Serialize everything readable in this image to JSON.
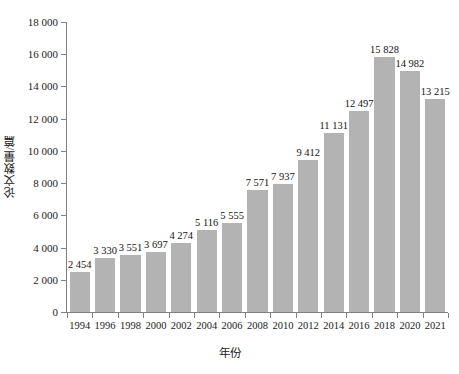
{
  "chart_data": {
    "type": "bar",
    "title": "",
    "xlabel": "年份",
    "ylabel": "论文数量/篇",
    "categories": [
      "1994",
      "1996",
      "1998",
      "2000",
      "2002",
      "2004",
      "2006",
      "2008",
      "2010",
      "2012",
      "2014",
      "2016",
      "2018",
      "2020",
      "2021"
    ],
    "values": [
      2454,
      3330,
      3551,
      3697,
      4274,
      5116,
      5555,
      7571,
      7937,
      9412,
      11131,
      12497,
      15828,
      14982,
      13215
    ],
    "value_labels": [
      "2 454",
      "3 330",
      "3 551",
      "3 697",
      "4 274",
      "5 116",
      "5 555",
      "7 571",
      "7 937",
      "9 412",
      "11 131",
      "12 497",
      "15 828",
      "14 982",
      "13 215"
    ],
    "ylim": [
      0,
      18000
    ],
    "ytick_values": [
      0,
      2000,
      4000,
      6000,
      8000,
      10000,
      12000,
      14000,
      16000,
      18000
    ],
    "ytick_labels": [
      "0",
      "2 000",
      "4 000",
      "6 000",
      "8 000",
      "10 000",
      "12 000",
      "14 000",
      "16 000",
      "18 000"
    ],
    "grid": false,
    "legend": null,
    "bar_color": "#b3b3b3",
    "axis_color": "#808080",
    "text_color": "#1a1a1a"
  }
}
